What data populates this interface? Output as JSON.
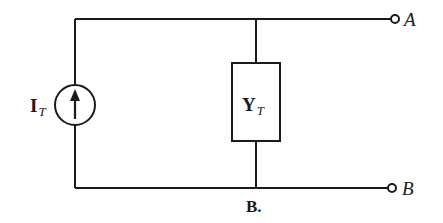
{
  "diagram": {
    "type": "circuit",
    "components": {
      "current_source": {
        "symbol": "I",
        "subscript": "T"
      },
      "admittance": {
        "symbol": "Y",
        "subscript": "T"
      }
    },
    "terminals": [
      {
        "id": "A",
        "label": "A"
      },
      {
        "id": "B",
        "label": "B"
      }
    ],
    "caption": "B.",
    "colors": {
      "line": "#1a1a1a",
      "background": "#ffffff"
    }
  }
}
